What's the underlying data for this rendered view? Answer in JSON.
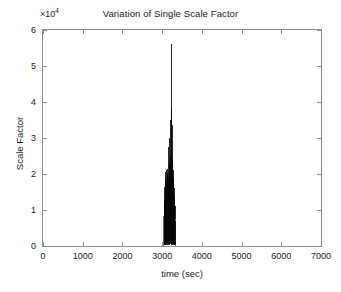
{
  "figure": {
    "width": 341,
    "height": 292,
    "background": "#ffffff",
    "axes_color": "#8d8d8d",
    "text_color": "#1a1a1a"
  },
  "chart_data": {
    "type": "line",
    "title": "Variation of Single Scale Factor",
    "xlabel": "time (sec)",
    "ylabel": "Scale Factor",
    "y_exponent_label": "×10",
    "y_exponent_power": "4",
    "y_scale_multiplier": 10000,
    "xlim": [
      0,
      7000
    ],
    "ylim": [
      0,
      60000
    ],
    "xticks": [
      0,
      1000,
      2000,
      3000,
      4000,
      5000,
      6000,
      7000
    ],
    "xticklabels": [
      "0",
      "1000",
      "2000",
      "3000",
      "4000",
      "5000",
      "6000",
      "7000"
    ],
    "yticks": [
      0,
      10000,
      20000,
      30000,
      40000,
      50000,
      60000
    ],
    "yticklabels": [
      "0",
      "1",
      "2",
      "3",
      "4",
      "5",
      "6"
    ],
    "grid": false,
    "legend": null,
    "line_color": "#000000",
    "line_width": 0.6,
    "series": [
      {
        "name": "Single Scale Factor",
        "x": [
          0,
          500,
          1000,
          1500,
          2000,
          2500,
          2900,
          3000,
          3040,
          3050,
          3056,
          3062,
          3068,
          3074,
          3080,
          3086,
          3092,
          3098,
          3104,
          3110,
          3116,
          3122,
          3128,
          3134,
          3140,
          3146,
          3152,
          3158,
          3164,
          3170,
          3176,
          3182,
          3188,
          3194,
          3200,
          3206,
          3212,
          3218,
          3224,
          3230,
          3236,
          3242,
          3248,
          3254,
          3260,
          3266,
          3272,
          3278,
          3284,
          3290,
          3296,
          3302,
          3308,
          3314,
          3320,
          3326,
          3332,
          3338,
          3344,
          3350,
          3400,
          3600,
          4000,
          4500,
          5000,
          5500,
          6000,
          6500,
          7000
        ],
        "y": [
          0,
          0,
          0,
          0,
          0,
          0,
          0,
          0,
          0,
          12000,
          300,
          16500,
          400,
          19000,
          600,
          20500,
          200,
          18000,
          500,
          21000,
          300,
          17500,
          700,
          20000,
          400,
          21500,
          250,
          19500,
          600,
          27500,
          350,
          23000,
          500,
          30000,
          450,
          25000,
          700,
          35000,
          300,
          38000,
          400,
          56000,
          350,
          33500,
          600,
          24000,
          400,
          21000,
          300,
          19000,
          500,
          16000,
          350,
          14000,
          400,
          11000,
          300,
          7000,
          200,
          0,
          0,
          0,
          0,
          0,
          0,
          0,
          0,
          0,
          0
        ],
        "burst_start": 3050,
        "burst_end": 3350,
        "max_value": 56000,
        "max_at": 3236,
        "secondary_peaks": [
          38000,
          35000,
          33500,
          30000
        ],
        "dense_base_top": 21000
      }
    ]
  }
}
